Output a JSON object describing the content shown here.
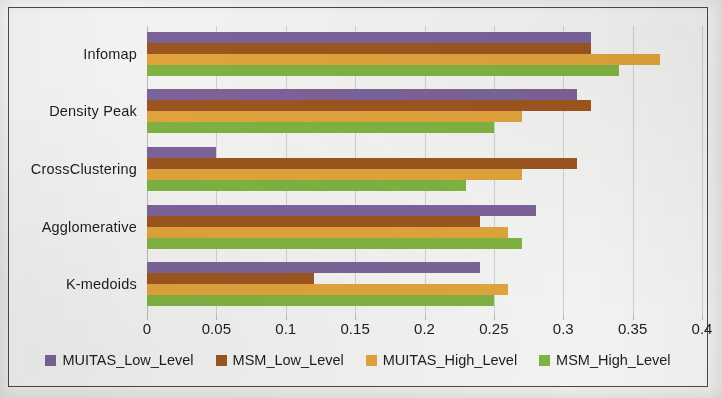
{
  "chart_data": {
    "type": "bar",
    "orientation": "horizontal",
    "title": "",
    "xlabel": "",
    "ylabel": "",
    "xlim": [
      0,
      0.4
    ],
    "xticks": [
      "0",
      "0.05",
      "0.1",
      "0.15",
      "0.2",
      "0.25",
      "0.3",
      "0.35",
      "0.4"
    ],
    "xtick_values": [
      0,
      0.05,
      0.1,
      0.15,
      0.2,
      0.25,
      0.3,
      0.35,
      0.4
    ],
    "grid": true,
    "legend_position": "bottom",
    "categories": [
      "K-medoids",
      "Agglomerative",
      "CrossClustering",
      "Density Peak",
      "Infomap"
    ],
    "series": [
      {
        "name": "MUITAS_Low_Level",
        "color": "#7B6399",
        "values": [
          0.24,
          0.28,
          0.05,
          0.31,
          0.32
        ]
      },
      {
        "name": "MSM_Low_Level",
        "color": "#9C5520",
        "values": [
          0.12,
          0.24,
          0.31,
          0.32,
          0.32
        ]
      },
      {
        "name": "MUITAS_High_Level",
        "color": "#E0A33C",
        "values": [
          0.26,
          0.26,
          0.27,
          0.27,
          0.37
        ]
      },
      {
        "name": "MSM_High_Level",
        "color": "#7FB241",
        "values": [
          0.25,
          0.27,
          0.23,
          0.25,
          0.34
        ]
      }
    ]
  },
  "colors": {
    "frame_border": "#4a4a4a",
    "plot_background": "#f2f2f0",
    "gridline": "#cfcfcf",
    "text": "#1d1d1d"
  }
}
